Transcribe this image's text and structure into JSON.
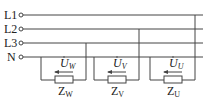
{
  "diagram": {
    "type": "three-phase four-wire star load circuit",
    "lines": [
      {
        "label": "L1",
        "y": 15
      },
      {
        "label": "L2",
        "y": 29
      },
      {
        "label": "L3",
        "y": 43
      },
      {
        "label": "N",
        "y": 57
      }
    ],
    "loads": [
      {
        "voltage_symbol": "U",
        "voltage_sub": "W",
        "impedance_symbol": "Z",
        "impedance_sub": "W"
      },
      {
        "voltage_symbol": "U",
        "voltage_sub": "V",
        "impedance_symbol": "Z",
        "impedance_sub": "V"
      },
      {
        "voltage_symbol": "U",
        "voltage_sub": "U",
        "impedance_symbol": "Z",
        "impedance_sub": "U"
      }
    ],
    "colors": {
      "line": "#333333",
      "background": "#ffffff"
    }
  }
}
